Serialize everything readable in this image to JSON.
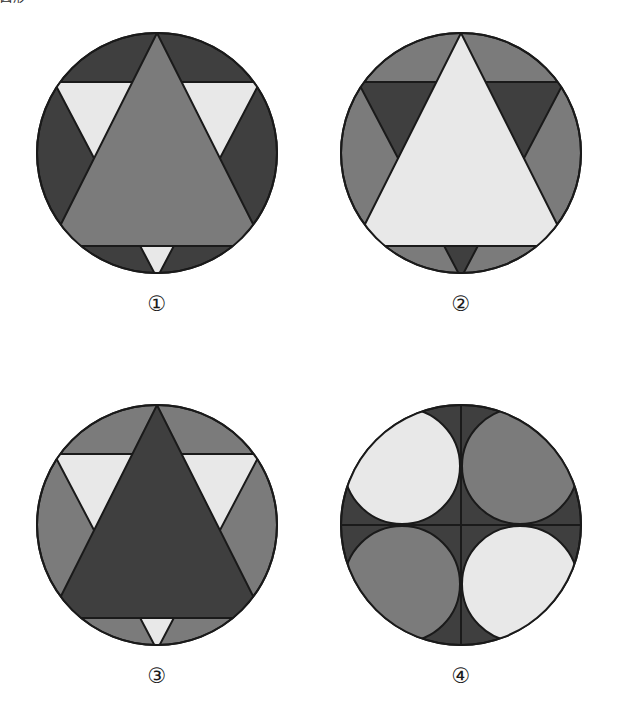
{
  "page": {
    "corner_text": "図形",
    "background_color": "#ffffff",
    "width": 618,
    "height": 717
  },
  "palette": {
    "dark_gray": "#3f3f3f",
    "medium_gray": "#7b7b7b",
    "light_gray": "#e8e8e8",
    "outline": "#1a1a1a",
    "white": "#ffffff"
  },
  "figures": [
    {
      "id": "figure-1",
      "caption": "①",
      "number": "1",
      "shape_kind": "hexagram-in-circle",
      "circle_fill": "#3f3f3f",
      "up_triangle_fill": "#7b7b7b",
      "down_triangle_fill": "#e8e8e8",
      "description": "Dark circle with medium gray upward triangle overlapping a light gray downward triangle"
    },
    {
      "id": "figure-2",
      "caption": "②",
      "number": "2",
      "shape_kind": "hexagram-in-circle",
      "circle_fill": "#7b7b7b",
      "up_triangle_fill": "#e8e8e8",
      "down_triangle_fill": "#3f3f3f",
      "description": "Medium gray circle with light gray upward triangle overlapping a dark gray downward triangle"
    },
    {
      "id": "figure-3",
      "caption": "③",
      "number": "3",
      "shape_kind": "hexagram-in-circle",
      "circle_fill": "#7b7b7b",
      "up_triangle_fill": "#3f3f3f",
      "down_triangle_fill": "#e8e8e8",
      "description": "Medium gray circle with dark gray upward triangle overlapping a light gray downward triangle"
    },
    {
      "id": "figure-4",
      "caption": "④",
      "number": "4",
      "shape_kind": "four-circles-in-circle",
      "circle_fill": "#3f3f3f",
      "quadrant_fills": {
        "top_left": "#e8e8e8",
        "top_right": "#7b7b7b",
        "bottom_left": "#7b7b7b",
        "bottom_right": "#e8e8e8"
      },
      "cross_lines": true,
      "description": "Dark gray circle divided by a vertical and horizontal line, containing four inscribed circles alternating light and medium gray"
    }
  ]
}
